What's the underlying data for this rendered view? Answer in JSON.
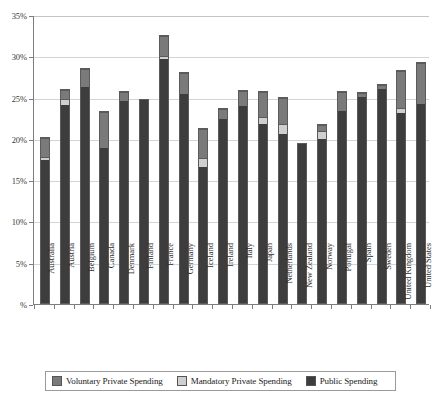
{
  "chart_data": {
    "type": "bar",
    "stacked": true,
    "title": "",
    "subtitle": "",
    "xlabel": "",
    "ylabel": "",
    "ylim": [
      0,
      35
    ],
    "y_tick_labels": [
      "%",
      "5%",
      "10%",
      "15%",
      "20%",
      "25%",
      "30%",
      "35%"
    ],
    "y_tick_values": [
      0,
      5,
      10,
      15,
      20,
      25,
      30,
      35
    ],
    "y_axis_unit": "%",
    "grid": true,
    "grid_axis": "y",
    "legend_position": "bottom",
    "categories": [
      "Australia",
      "Austria",
      "Belgium",
      "Canada",
      "Denmark",
      "Finland",
      "France",
      "Germany",
      "Iceland",
      "Ireland",
      "Italy",
      "Japan",
      "Netherlands",
      "New Zealand",
      "Norway",
      "Portugal",
      "Spain",
      "Sweden",
      "United Kingdom",
      "United States"
    ],
    "series": [
      {
        "name": "Public Spending",
        "color": "#3d3d3d",
        "values": [
          17.3,
          24.0,
          26.2,
          18.8,
          24.5,
          24.6,
          29.5,
          25.3,
          16.5,
          22.3,
          23.9,
          21.7,
          20.5,
          19.2,
          19.9,
          23.3,
          25.0,
          25.9,
          23.0,
          24.1
        ]
      },
      {
        "name": "Mandatory Private Spending",
        "color": "#cfcfcf",
        "values": [
          0.3,
          0.6,
          0.0,
          0.0,
          0.0,
          0.0,
          0.3,
          0.0,
          0.9,
          0.0,
          0.0,
          0.7,
          1.1,
          0.0,
          0.8,
          0.0,
          0.0,
          0.0,
          0.5,
          0.0
        ]
      },
      {
        "name": "Voluntary Private Spending",
        "color": "#7a7a7a",
        "values": [
          2.1,
          1.0,
          2.0,
          4.2,
          0.9,
          0.0,
          2.3,
          2.4,
          3.4,
          1.1,
          1.6,
          2.9,
          3.0,
          0.0,
          0.6,
          2.1,
          0.3,
          0.4,
          4.4,
          4.8
        ]
      }
    ],
    "totals": [
      19.7,
      25.6,
      28.2,
      23.0,
      25.4,
      24.6,
      32.1,
      27.7,
      20.8,
      23.4,
      25.5,
      25.3,
      24.6,
      19.2,
      21.3,
      25.4,
      25.3,
      26.3,
      27.9,
      28.9
    ],
    "legend": [
      {
        "label": "Voluntary Private Spending",
        "swatch": "sw-voluntary",
        "icon": "square-swatch-icon"
      },
      {
        "label": "Mandatory Private Spending",
        "swatch": "sw-mandatory",
        "icon": "square-swatch-icon"
      },
      {
        "label": "Public Spending",
        "swatch": "sw-public",
        "icon": "square-swatch-icon"
      }
    ],
    "colors": {
      "public": "#3d3d3d",
      "mandatory": "#cfcfcf",
      "voluntary": "#7a7a7a",
      "axis": "#7d7d7d",
      "grid": "#d4d4d4",
      "background": "#ffffff"
    }
  }
}
